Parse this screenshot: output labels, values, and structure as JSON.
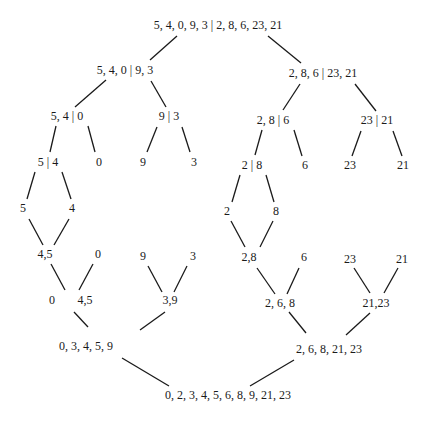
{
  "diagram": {
    "type": "merge-sort-tree",
    "colors": {
      "text": "#1a1a1a",
      "line": "#1a1a1a",
      "background": "#ffffff"
    },
    "nodes": [
      {
        "id": "n0",
        "label": "5, 4, 0, 9, 3 | 2, 8, 6, 23, 21",
        "x": 218,
        "y": 25
      },
      {
        "id": "n1",
        "label": "5, 4, 0 | 9, 3",
        "x": 125,
        "y": 70
      },
      {
        "id": "n2",
        "label": "2, 8, 6 | 23, 21",
        "x": 323,
        "y": 73
      },
      {
        "id": "n3",
        "label": "5, 4 | 0",
        "x": 67,
        "y": 116
      },
      {
        "id": "n4",
        "label": "9 | 3",
        "x": 169,
        "y": 116
      },
      {
        "id": "n5",
        "label": "2, 8 | 6",
        "x": 273,
        "y": 120
      },
      {
        "id": "n6",
        "label": "23 | 21",
        "x": 377,
        "y": 120
      },
      {
        "id": "n7",
        "label": "5 | 4",
        "x": 48,
        "y": 162
      },
      {
        "id": "n8",
        "label": "0",
        "x": 99,
        "y": 162
      },
      {
        "id": "n9",
        "label": "9",
        "x": 143,
        "y": 162
      },
      {
        "id": "n10",
        "label": "3",
        "x": 194,
        "y": 162
      },
      {
        "id": "n11",
        "label": "2 | 8",
        "x": 252,
        "y": 165
      },
      {
        "id": "n12",
        "label": "6",
        "x": 305,
        "y": 165
      },
      {
        "id": "n13",
        "label": "23",
        "x": 350,
        "y": 165
      },
      {
        "id": "n14",
        "label": "21",
        "x": 403,
        "y": 165
      },
      {
        "id": "n15",
        "label": "5",
        "x": 23,
        "y": 208
      },
      {
        "id": "n16",
        "label": "4",
        "x": 72,
        "y": 208
      },
      {
        "id": "n17",
        "label": "2",
        "x": 227,
        "y": 211
      },
      {
        "id": "n18",
        "label": "8",
        "x": 276,
        "y": 211
      },
      {
        "id": "n19",
        "label": "4,5",
        "x": 45,
        "y": 254
      },
      {
        "id": "n20",
        "label": "0",
        "x": 98,
        "y": 254
      },
      {
        "id": "n21",
        "label": "9",
        "x": 143,
        "y": 256
      },
      {
        "id": "n22",
        "label": "3",
        "x": 193,
        "y": 256
      },
      {
        "id": "n23",
        "label": "2,8",
        "x": 249,
        "y": 257
      },
      {
        "id": "n24",
        "label": "6",
        "x": 304,
        "y": 257
      },
      {
        "id": "n25",
        "label": "23",
        "x": 350,
        "y": 259
      },
      {
        "id": "n26",
        "label": "21",
        "x": 402,
        "y": 259
      },
      {
        "id": "n27",
        "label": "0",
        "x": 52,
        "y": 300
      },
      {
        "id": "n28",
        "label": "4,5",
        "x": 85,
        "y": 300
      },
      {
        "id": "n29",
        "label": "3,9",
        "x": 170,
        "y": 300
      },
      {
        "id": "n30",
        "label": "2, 6, 8",
        "x": 280,
        "y": 303
      },
      {
        "id": "n31",
        "label": "21,23",
        "x": 376,
        "y": 303
      },
      {
        "id": "n32",
        "label": "0, 3, 4, 5, 9",
        "x": 86,
        "y": 346
      },
      {
        "id": "n33",
        "label": "2, 6, 8, 21, 23",
        "x": 329,
        "y": 349
      },
      {
        "id": "n34",
        "label": "0, 2, 3, 4, 5, 6, 8, 9, 21, 23",
        "x": 228,
        "y": 395
      }
    ],
    "edges": [
      {
        "from": "n0",
        "to": "n1",
        "x1": 177,
        "y1": 36,
        "x2": 150,
        "y2": 60
      },
      {
        "from": "n0",
        "to": "n2",
        "x1": 268,
        "y1": 36,
        "x2": 301,
        "y2": 63
      },
      {
        "from": "n1",
        "to": "n3",
        "x1": 106,
        "y1": 80,
        "x2": 75,
        "y2": 107
      },
      {
        "from": "n1",
        "to": "n4",
        "x1": 151,
        "y1": 81,
        "x2": 166,
        "y2": 107
      },
      {
        "from": "n2",
        "to": "n5",
        "x1": 300,
        "y1": 84,
        "x2": 283,
        "y2": 110
      },
      {
        "from": "n2",
        "to": "n6",
        "x1": 355,
        "y1": 84,
        "x2": 376,
        "y2": 111
      },
      {
        "from": "n3",
        "to": "n7",
        "x1": 56,
        "y1": 126,
        "x2": 50,
        "y2": 152
      },
      {
        "from": "n3",
        "to": "n8",
        "x1": 88,
        "y1": 126,
        "x2": 95,
        "y2": 152
      },
      {
        "from": "n4",
        "to": "n9",
        "x1": 157,
        "y1": 127,
        "x2": 147,
        "y2": 152
      },
      {
        "from": "n4",
        "to": "n10",
        "x1": 182,
        "y1": 127,
        "x2": 190,
        "y2": 152
      },
      {
        "from": "n5",
        "to": "n11",
        "x1": 262,
        "y1": 130,
        "x2": 255,
        "y2": 155
      },
      {
        "from": "n5",
        "to": "n12",
        "x1": 294,
        "y1": 130,
        "x2": 302,
        "y2": 156
      },
      {
        "from": "n6",
        "to": "n13",
        "x1": 361,
        "y1": 131,
        "x2": 352,
        "y2": 156
      },
      {
        "from": "n6",
        "to": "n14",
        "x1": 393,
        "y1": 131,
        "x2": 402,
        "y2": 156
      },
      {
        "from": "n7",
        "to": "n15",
        "x1": 35,
        "y1": 172,
        "x2": 27,
        "y2": 199
      },
      {
        "from": "n7",
        "to": "n16",
        "x1": 62,
        "y1": 172,
        "x2": 71,
        "y2": 199
      },
      {
        "from": "n11",
        "to": "n17",
        "x1": 240,
        "y1": 175,
        "x2": 232,
        "y2": 202
      },
      {
        "from": "n11",
        "to": "n18",
        "x1": 266,
        "y1": 175,
        "x2": 274,
        "y2": 202
      },
      {
        "from": "n15",
        "to": "n19",
        "x1": 29,
        "y1": 219,
        "x2": 43,
        "y2": 245
      },
      {
        "from": "n16",
        "to": "n19",
        "x1": 69,
        "y1": 219,
        "x2": 54,
        "y2": 245
      },
      {
        "from": "n17",
        "to": "n23",
        "x1": 231,
        "y1": 221,
        "x2": 245,
        "y2": 247
      },
      {
        "from": "n18",
        "to": "n23",
        "x1": 273,
        "y1": 221,
        "x2": 260,
        "y2": 247
      },
      {
        "from": "n19",
        "to": "n28",
        "x1": 51,
        "y1": 264,
        "x2": 65,
        "y2": 290
      },
      {
        "from": "n20",
        "to": "n28",
        "x1": 93,
        "y1": 264,
        "x2": 79,
        "y2": 290
      },
      {
        "from": "n21",
        "to": "n29",
        "x1": 148,
        "y1": 266,
        "x2": 162,
        "y2": 292
      },
      {
        "from": "n22",
        "to": "n29",
        "x1": 187,
        "y1": 266,
        "x2": 174,
        "y2": 292
      },
      {
        "from": "n23",
        "to": "n30",
        "x1": 257,
        "y1": 268,
        "x2": 275,
        "y2": 294
      },
      {
        "from": "n24",
        "to": "n30",
        "x1": 299,
        "y1": 268,
        "x2": 287,
        "y2": 294
      },
      {
        "from": "n25",
        "to": "n31",
        "x1": 354,
        "y1": 268,
        "x2": 370,
        "y2": 293
      },
      {
        "from": "n26",
        "to": "n31",
        "x1": 398,
        "y1": 268,
        "x2": 384,
        "y2": 293
      },
      {
        "from": "n28",
        "to": "n32",
        "x1": 74,
        "y1": 312,
        "x2": 88,
        "y2": 327
      },
      {
        "from": "n29",
        "to": "n32",
        "x1": 165,
        "y1": 312,
        "x2": 140,
        "y2": 330
      },
      {
        "from": "n30",
        "to": "n33",
        "x1": 289,
        "y1": 312,
        "x2": 306,
        "y2": 333
      },
      {
        "from": "n31",
        "to": "n33",
        "x1": 370,
        "y1": 313,
        "x2": 346,
        "y2": 335
      },
      {
        "from": "n32",
        "to": "n34",
        "x1": 122,
        "y1": 358,
        "x2": 169,
        "y2": 386
      },
      {
        "from": "n33",
        "to": "n34",
        "x1": 294,
        "y1": 360,
        "x2": 250,
        "y2": 386
      }
    ]
  }
}
